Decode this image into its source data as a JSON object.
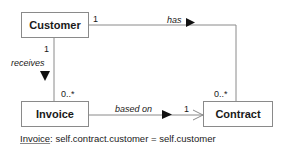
{
  "diagram": {
    "type": "uml-class-diagram",
    "classes": [
      {
        "id": "customer",
        "name": "Customer"
      },
      {
        "id": "invoice",
        "name": "Invoice"
      },
      {
        "id": "contract",
        "name": "Contract"
      }
    ],
    "associations": [
      {
        "name": "has",
        "from": "Customer",
        "to": "Contract",
        "from_mult": "1",
        "to_mult": "0..*",
        "direction_marker": "▶"
      },
      {
        "name": "receives",
        "from": "Customer",
        "to": "Invoice",
        "from_mult": "1",
        "to_mult": "0..*",
        "direction_marker": "▼"
      },
      {
        "name": "based on",
        "from": "Invoice",
        "to": "Contract",
        "from_mult": "",
        "to_mult": "1",
        "direction_marker": "▶",
        "navigable_arrow": true
      }
    ],
    "constraint": {
      "context": "Invoice",
      "separator": ":",
      "expression": " self.contract.customer = self.customer"
    },
    "colors": {
      "line": "#8a8a8a",
      "text": "#1a1a1a",
      "background": "#ffffff"
    }
  }
}
